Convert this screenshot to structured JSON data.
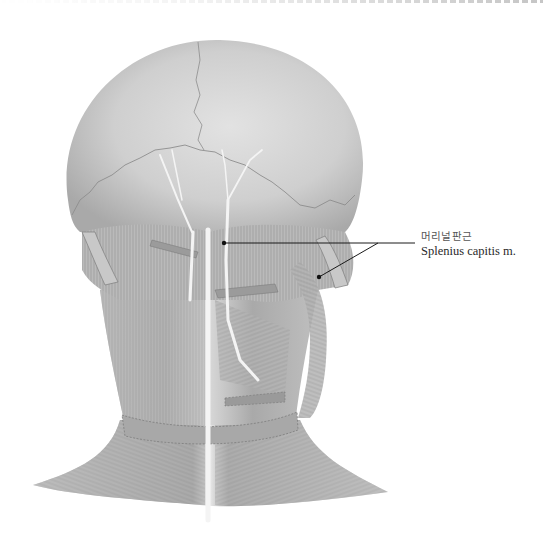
{
  "figure": {
    "colors": {
      "background": "#ffffff",
      "skull": "#c9c9c9",
      "muscle": "#b5b5b5",
      "nerve": "#f2f2f2",
      "leader_line": "#1a1a1a"
    }
  },
  "labels": [
    {
      "korean": "머리널판근",
      "english": "Splenius capitis m.",
      "pointers": [
        {
          "x": 224,
          "y": 243
        },
        {
          "x": 319,
          "y": 277
        }
      ],
      "junction": {
        "x": 378,
        "y": 243
      }
    }
  ]
}
